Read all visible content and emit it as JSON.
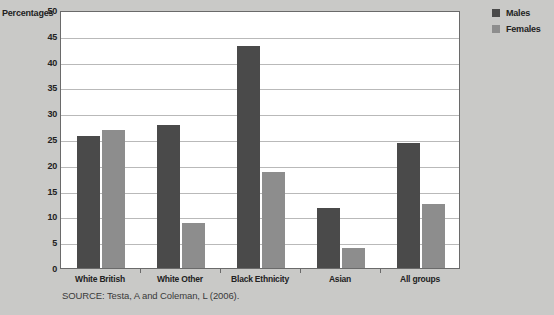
{
  "chart_data": {
    "type": "bar",
    "title": "",
    "xlabel": "",
    "ylabel": "Percentages",
    "ylim": [
      0,
      50
    ],
    "yticks": [
      50,
      45,
      40,
      35,
      30,
      25,
      20,
      15,
      10,
      5,
      0
    ],
    "grid": true,
    "legend_position": "right",
    "categories": [
      "White British",
      "White Other",
      "Black Ethnicity",
      "Asian",
      "All groups"
    ],
    "series": [
      {
        "name": "Males",
        "color": "#4a4a4a",
        "values": [
          25.5,
          27.8,
          43.0,
          11.7,
          24.2
        ]
      },
      {
        "name": "Females",
        "color": "#8d8d8d",
        "values": [
          26.7,
          8.8,
          18.7,
          3.9,
          12.5
        ]
      }
    ],
    "source": "SOURCE: Testa, A and Coleman, L (2006)."
  },
  "axis": {
    "y_title": "Percentages"
  },
  "legend": {
    "items": [
      {
        "label": "Males"
      },
      {
        "label": "Females"
      }
    ]
  },
  "footer": {
    "source": "SOURCE: Testa, A and Coleman, L (2006)."
  },
  "colors": {
    "males": "#4a4a4a",
    "females": "#8d8d8d",
    "background": "#c9c9c7",
    "plot_background": "#ffffff",
    "gridline": "#b9b9b9",
    "frame": "#6a6a6a"
  }
}
